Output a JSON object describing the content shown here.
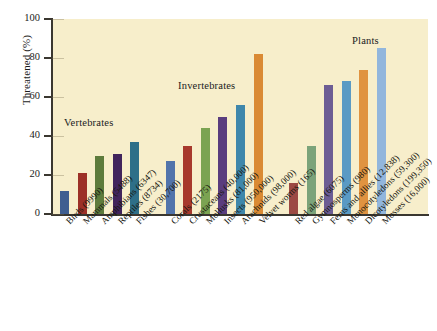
{
  "chart_data": {
    "type": "bar",
    "title": "",
    "xlabel": "",
    "ylabel": "Threatened (%)",
    "ylim": [
      0,
      100
    ],
    "yticks": [
      0,
      20,
      40,
      60,
      80,
      100
    ],
    "ytick_labels": [
      "0",
      "20",
      "40",
      "60",
      "80",
      "100"
    ],
    "grid": false,
    "legend_position": "none",
    "group_labels": [
      "Vertebrates",
      "Invertebrates",
      "Plants"
    ],
    "categories": [
      "Birds (9990)",
      "Mammals (5488)",
      "Amphibians (6347)",
      "Reptiles (8734)",
      "Fishes (30,700)",
      "Corals (2175)",
      "Crustaceans (40,000)",
      "Mollusks (81,000)",
      "Insects (950,000)",
      "Arachnids (98,000)",
      "Velvet worms (165)",
      "Red algae (6075)",
      "Gymnosperms (980)",
      "Ferns and allies (12,838)",
      "Monocotyledons (59,300)",
      "Dicotyledons (199,350)",
      "Mosses (16,000)"
    ],
    "values": [
      12,
      21,
      30,
      31,
      37,
      27,
      35,
      44,
      50,
      56,
      82,
      16,
      35,
      66,
      68,
      74,
      85
    ],
    "colors": [
      "#3f5e90",
      "#9c3027",
      "#5d7b3c",
      "#41245c",
      "#2e6f88",
      "#5274ab",
      "#a7392c",
      "#7ba352",
      "#5a3d7e",
      "#3f87ab",
      "#da8a34",
      "#9c4a44",
      "#7ba37a",
      "#6d5d94",
      "#5a9ac4",
      "#e09340",
      "#92b6dc"
    ]
  }
}
